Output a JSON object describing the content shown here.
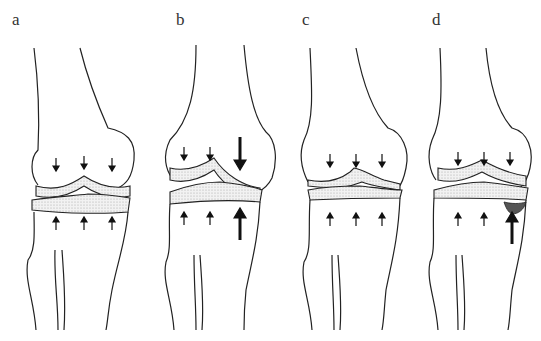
{
  "figure": {
    "panels": [
      {
        "label": "a",
        "left": 8,
        "variant": "normal"
      },
      {
        "label": "b",
        "left": 148,
        "variant": "asymmetric-load"
      },
      {
        "label": "c",
        "left": 288,
        "variant": "degenerated-cartilage"
      },
      {
        "label": "d",
        "left": 420,
        "variant": "subchondral-lesion"
      }
    ]
  }
}
